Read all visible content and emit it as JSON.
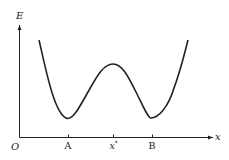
{
  "diagram": {
    "type": "potential-energy-curve",
    "y_axis_label": "E",
    "x_axis_label": "x",
    "origin_label": "O",
    "tick_labels": {
      "A": "A",
      "x_star_base": "x",
      "x_star_sup": "*",
      "B": "B"
    },
    "colors": {
      "line": "#222222",
      "background": "#ffffff"
    }
  }
}
